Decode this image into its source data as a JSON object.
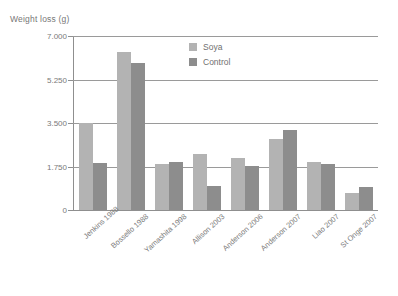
{
  "chart_data": {
    "type": "bar",
    "title": "",
    "xlabel": "",
    "ylabel": "Weight loss (g)",
    "ylim": [
      0,
      7000
    ],
    "yticks": [
      "0",
      "1.750",
      "3.500",
      "5.250",
      "7.000"
    ],
    "ytick_values": [
      0,
      1750,
      3500,
      5250,
      7000
    ],
    "grid": "horizontal",
    "legend_position": "inside-top-center",
    "categories": [
      "Jenkins 1988",
      "Bossello 1988",
      "Yamashita 1998",
      "Allison 2003",
      "Anderson 2006",
      "Anderson 2007",
      "Liao 2007",
      "St Onge 2007"
    ],
    "series": [
      {
        "name": "Soya",
        "color": "#b3b3b3",
        "values": [
          3500,
          6350,
          1860,
          2250,
          2110,
          2870,
          1950,
          700
        ]
      },
      {
        "name": "Control",
        "color": "#8d8d8d",
        "values": [
          1910,
          5920,
          1930,
          980,
          1780,
          3200,
          1870,
          930
        ]
      }
    ]
  },
  "legend": {
    "items": [
      {
        "label": "Soya"
      },
      {
        "label": "Control"
      }
    ]
  },
  "colors": {
    "soya": "#b3b3b3",
    "control": "#8d8d8d",
    "grid": "#9a9a9a",
    "text": "#7a7a7a",
    "background": "#ffffff"
  }
}
